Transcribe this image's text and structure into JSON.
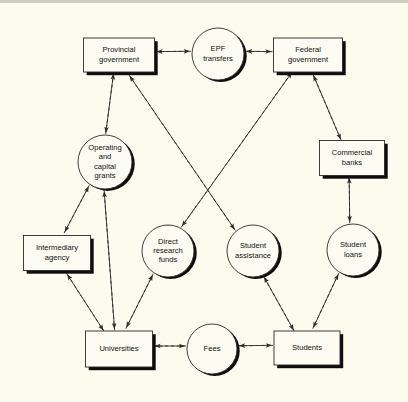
{
  "diagram": {
    "background_color": "#fbfbee",
    "ink_color": "#2b2b2b",
    "shadow_color": "#0d0d0d",
    "nodes": [
      {
        "id": "provincial_government",
        "shape": "box",
        "label_lines": [
          "Provincial",
          "government"
        ],
        "cx": 119,
        "cy": 55,
        "w": 71,
        "h": 34
      },
      {
        "id": "epf_transfers",
        "shape": "circle",
        "label_lines": [
          "EPF",
          "transfers"
        ],
        "cx": 218,
        "cy": 54,
        "r": 26
      },
      {
        "id": "federal_government",
        "shape": "box",
        "label_lines": [
          "Federal",
          "government"
        ],
        "cx": 308,
        "cy": 55,
        "w": 69,
        "h": 34
      },
      {
        "id": "operating_capital_grants",
        "shape": "circle",
        "label_lines": [
          "Operating",
          "and",
          "capital",
          "grants"
        ],
        "cx": 105,
        "cy": 162,
        "r": 27
      },
      {
        "id": "commercial_banks",
        "shape": "box",
        "label_lines": [
          "Commercial",
          "banks"
        ],
        "cx": 352,
        "cy": 158,
        "w": 65,
        "h": 35
      },
      {
        "id": "intermediary_agency",
        "shape": "box",
        "label_lines": [
          "Intermediary",
          "agency"
        ],
        "cx": 57,
        "cy": 253,
        "w": 67,
        "h": 35
      },
      {
        "id": "direct_research_funds",
        "shape": "circle",
        "label_lines": [
          "Direct",
          "research",
          "funds"
        ],
        "cx": 168,
        "cy": 251,
        "r": 26
      },
      {
        "id": "student_assistance",
        "shape": "circle",
        "label_lines": [
          "Student",
          "assistance"
        ],
        "cx": 253,
        "cy": 251,
        "r": 26
      },
      {
        "id": "student_loans",
        "shape": "circle",
        "label_lines": [
          "Student",
          "loans"
        ],
        "cx": 353,
        "cy": 250,
        "r": 26
      },
      {
        "id": "universities",
        "shape": "box",
        "label_lines": [
          "Universities"
        ],
        "cx": 119,
        "cy": 349,
        "w": 67,
        "h": 36
      },
      {
        "id": "fees",
        "shape": "circle",
        "label_lines": [
          "Fees"
        ],
        "cx": 212,
        "cy": 349,
        "r": 25
      },
      {
        "id": "students",
        "shape": "box",
        "label_lines": [
          "Students"
        ],
        "cx": 307,
        "cy": 348,
        "w": 66,
        "h": 34
      }
    ],
    "edges": [
      {
        "id": "epf-to-provincial",
        "style": "solid",
        "from": "epf_transfers",
        "to": "provincial_government",
        "meaning": "cash flow"
      },
      {
        "id": "provincial-to-epf",
        "style": "dashed",
        "from": "provincial_government",
        "to": "epf_transfers",
        "meaning": "service/claim flow"
      },
      {
        "id": "epf-to-federal",
        "style": "dashed",
        "from": "epf_transfers",
        "to": "federal_government",
        "meaning": "service/claim flow"
      },
      {
        "id": "federal-to-epf",
        "style": "solid",
        "from": "federal_government",
        "to": "epf_transfers",
        "meaning": "cash flow"
      },
      {
        "id": "provincial-to-grants",
        "style": "solid",
        "from": "provincial_government",
        "to": "operating_capital_grants",
        "meaning": "cash flow"
      },
      {
        "id": "grants-to-provincial",
        "style": "dashed",
        "from": "operating_capital_grants",
        "to": "provincial_government",
        "meaning": "service/claim flow"
      },
      {
        "id": "grants-to-intermediary",
        "style": "solid",
        "from": "operating_capital_grants",
        "to": "intermediary_agency",
        "meaning": "cash flow"
      },
      {
        "id": "intermediary-to-grants",
        "style": "dashed",
        "from": "intermediary_agency",
        "to": "operating_capital_grants",
        "meaning": "service/claim flow"
      },
      {
        "id": "grants-to-universities",
        "style": "solid",
        "from": "operating_capital_grants",
        "to": "universities",
        "meaning": "cash flow"
      },
      {
        "id": "universities-to-grants",
        "style": "dashed",
        "from": "universities",
        "to": "operating_capital_grants",
        "meaning": "service/claim flow"
      },
      {
        "id": "intermediary-to-universities",
        "style": "solid",
        "from": "intermediary_agency",
        "to": "universities",
        "meaning": "cash flow"
      },
      {
        "id": "universities-to-intermediary",
        "style": "dashed",
        "from": "universities",
        "to": "intermediary_agency",
        "meaning": "service/claim flow"
      },
      {
        "id": "federal-to-research",
        "style": "solid",
        "from": "federal_government",
        "to": "direct_research_funds",
        "meaning": "cash flow"
      },
      {
        "id": "research-to-federal",
        "style": "dashed",
        "from": "direct_research_funds",
        "to": "federal_government",
        "meaning": "service/claim flow"
      },
      {
        "id": "research-to-universities",
        "style": "solid",
        "from": "direct_research_funds",
        "to": "universities",
        "meaning": "cash flow"
      },
      {
        "id": "universities-to-research",
        "style": "dashed",
        "from": "universities",
        "to": "direct_research_funds",
        "meaning": "service/claim flow"
      },
      {
        "id": "provincial-to-assistance",
        "style": "solid",
        "from": "provincial_government",
        "to": "student_assistance",
        "meaning": "cash flow"
      },
      {
        "id": "assistance-to-provincial",
        "style": "dashed",
        "from": "student_assistance",
        "to": "provincial_government",
        "meaning": "service/claim flow"
      },
      {
        "id": "assistance-to-students",
        "style": "solid",
        "from": "student_assistance",
        "to": "students",
        "meaning": "cash flow"
      },
      {
        "id": "students-to-assistance",
        "style": "dashed",
        "from": "students",
        "to": "student_assistance",
        "meaning": "service/claim flow"
      },
      {
        "id": "federal-to-banks",
        "style": "solid",
        "from": "federal_government",
        "to": "commercial_banks",
        "meaning": "cash flow"
      },
      {
        "id": "banks-to-federal",
        "style": "dashed",
        "from": "commercial_banks",
        "to": "federal_government",
        "meaning": "service/claim flow"
      },
      {
        "id": "banks-to-loans",
        "style": "solid",
        "from": "commercial_banks",
        "to": "student_loans",
        "meaning": "cash flow"
      },
      {
        "id": "loans-to-banks",
        "style": "dashed",
        "from": "student_loans",
        "to": "commercial_banks",
        "meaning": "service/claim flow"
      },
      {
        "id": "loans-to-students",
        "style": "solid",
        "from": "student_loans",
        "to": "students",
        "meaning": "cash flow"
      },
      {
        "id": "students-to-loans",
        "style": "dashed",
        "from": "students",
        "to": "student_loans",
        "meaning": "service/claim flow"
      },
      {
        "id": "fees-to-universities",
        "style": "solid",
        "from": "fees",
        "to": "universities",
        "meaning": "cash flow"
      },
      {
        "id": "universities-to-fees",
        "style": "dashed",
        "from": "universities",
        "to": "fees",
        "meaning": "service/claim flow"
      },
      {
        "id": "fees-to-students",
        "style": "dashed",
        "from": "fees",
        "to": "students",
        "meaning": "service/claim flow"
      },
      {
        "id": "students-to-fees",
        "style": "solid",
        "from": "students",
        "to": "fees",
        "meaning": "cash flow"
      }
    ]
  }
}
